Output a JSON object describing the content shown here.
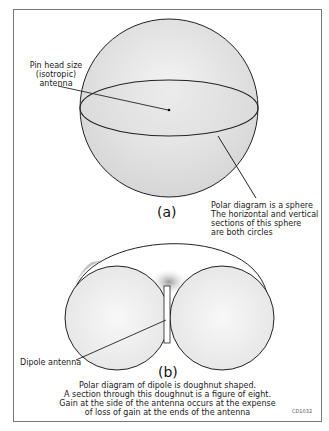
{
  "diagram": {
    "part_a": {
      "label": "(a)",
      "antenna_label": [
        "Pin head size",
        "(isotropic)",
        "antenna"
      ],
      "description": [
        "Polar diagram is a sphere",
        "The horizontal and vertical",
        "sections of this sphere",
        "are both circles"
      ]
    },
    "part_b": {
      "label": "(b)",
      "antenna_label": "Dipole antenna",
      "description": [
        "Polar diagram of dipole is doughnut shaped.",
        "A section through this doughnut is a figure of eight.",
        "Gain at the side of the antenna occurs at the expense",
        "of loss of gain at the ends of the antenna"
      ]
    },
    "figure_code": "CD1032"
  }
}
